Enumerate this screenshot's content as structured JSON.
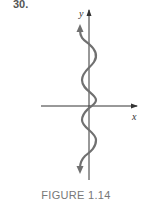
{
  "problem": {
    "number": "30."
  },
  "figure": {
    "caption": "FIGURE 1.14",
    "x_axis_label": "x",
    "y_axis_label": "y",
    "curve_description": "Sinusoidal curve oscillating horizontally about the y-axis, extending vertically with arrows at both ends (x = sin y shape)",
    "colors": {
      "curve": "#707070",
      "axes": "#333333",
      "caption": "#777777",
      "number": "#555555"
    }
  }
}
